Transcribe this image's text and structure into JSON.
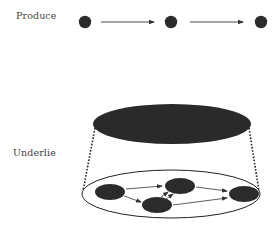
{
  "diagram": {
    "labels": {
      "top": "Produce",
      "bottom": "Underlie"
    },
    "colors": {
      "node": "#2b2b2b",
      "line": "#333333",
      "background": "#ffffff"
    },
    "top_row": {
      "nodes": 3,
      "arrows": [
        "node1 -> node2",
        "node2 -> node3"
      ]
    },
    "macro_node": "large dark ellipse",
    "micro_network": {
      "nodes": [
        "left",
        "lower-middle",
        "upper-middle",
        "right"
      ],
      "edges": [
        "left -> upper-middle",
        "left -> lower-middle",
        "lower-middle -> upper-middle",
        "lower-middle -> upper-middle",
        "upper-middle -> right",
        "lower-middle -> right"
      ]
    }
  }
}
